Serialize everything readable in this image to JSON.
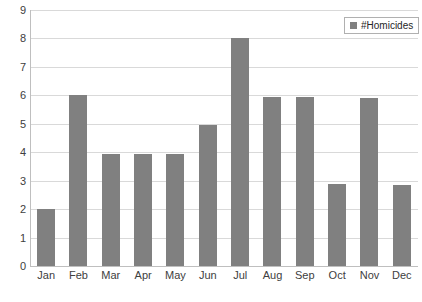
{
  "chart_data": {
    "type": "bar",
    "title": "",
    "subtitle": "",
    "xlabel": "",
    "ylabel": "",
    "categories": [
      "Jan",
      "Feb",
      "Mar",
      "Apr",
      "May",
      "Jun",
      "Jul",
      "Aug",
      "Sep",
      "Oct",
      "Nov",
      "Dec"
    ],
    "series": [
      {
        "name": "#Homicides",
        "values": [
          2,
          6,
          3.95,
          3.95,
          3.95,
          4.95,
          8,
          5.95,
          5.95,
          2.9,
          5.9,
          2.85
        ],
        "color": "#808080"
      }
    ],
    "ylim": [
      0,
      9
    ],
    "yticks": [
      0,
      1,
      2,
      3,
      4,
      5,
      6,
      7,
      8,
      9
    ],
    "ytick_labels": [
      "0",
      "1",
      "2",
      "3",
      "4",
      "5",
      "6",
      "7",
      "8",
      "9"
    ],
    "grid": "horizontal",
    "legend": {
      "position": "top-right",
      "entries": [
        {
          "label": "#Homicides",
          "marker": "square",
          "color": "#808080"
        }
      ]
    },
    "colors": {
      "bar": "#808080",
      "gridline": "#d9d9d9",
      "axis": "#bfbfbf",
      "text": "#404040",
      "background": "#ffffff"
    }
  }
}
